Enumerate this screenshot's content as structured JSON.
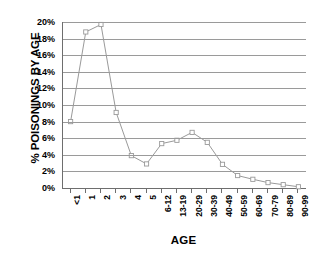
{
  "chart_data": {
    "type": "line",
    "title": "",
    "xlabel": "AGE",
    "ylabel": "% POISONINGS BY AGE",
    "categories": [
      "<1",
      "1",
      "2",
      "3",
      "4",
      "5",
      "6-12",
      "13-19",
      "20-29",
      "30-39",
      "40-49",
      "50-59",
      "60-69",
      "70-79",
      "80-89",
      "90-99"
    ],
    "values": [
      8.0,
      18.8,
      19.7,
      9.1,
      3.9,
      2.9,
      5.35,
      5.75,
      6.7,
      5.5,
      2.85,
      1.5,
      1.05,
      0.65,
      0.4,
      0.15
    ],
    "series": [
      {
        "name": "% Poisonings by Age",
        "values": [
          8.0,
          18.8,
          19.7,
          9.1,
          3.9,
          2.9,
          5.35,
          5.75,
          6.7,
          5.5,
          2.85,
          1.5,
          1.05,
          0.65,
          0.4,
          0.15
        ]
      }
    ],
    "ylim": [
      0,
      20
    ],
    "ytick_labels": [
      "0%",
      "2%",
      "4%",
      "6%",
      "8%",
      "10%",
      "12%",
      "14%",
      "16%",
      "18%",
      "20%"
    ],
    "ytick_values": [
      0,
      2,
      4,
      6,
      8,
      10,
      12,
      14,
      16,
      18,
      20
    ],
    "grid": true,
    "grid_axis": "y",
    "legend": false,
    "legend_position": "none",
    "marker": "open-square",
    "line_color": "#9a9a9a",
    "marker_color": "#9a9a9a",
    "grid_color": "#9a9a9a",
    "axis_color": "#6e6e6e",
    "background_color": "#ffffff",
    "text_color": "#000000"
  }
}
